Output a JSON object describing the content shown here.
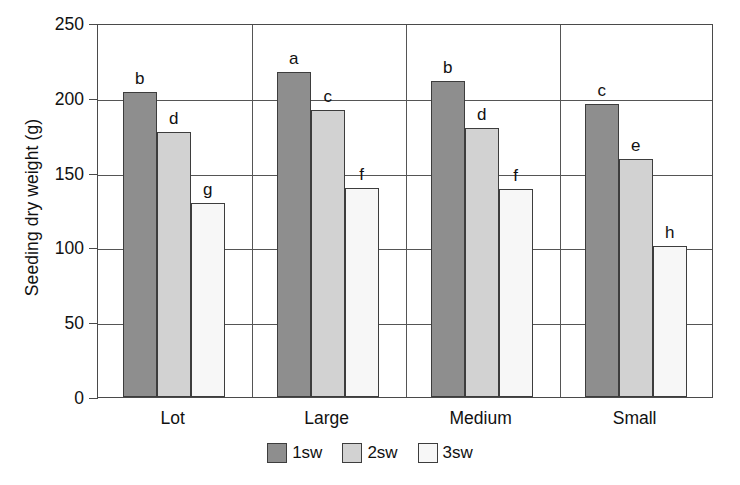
{
  "chart_data": {
    "type": "bar",
    "title": "",
    "xlabel": "",
    "ylabel": "Seeding dry weight (g)",
    "categories": [
      "Lot",
      "Large",
      "Medium",
      "Small"
    ],
    "ylim": [
      0,
      250
    ],
    "yticks": [
      0,
      50,
      100,
      150,
      200,
      250
    ],
    "ytick_labels": [
      "0",
      "50",
      "100",
      "150",
      "200",
      "250"
    ],
    "grid": true,
    "legend_position": "bottom",
    "series": [
      {
        "name": "1sw",
        "color": "#8e8e8e",
        "values": [
          204,
          217,
          211,
          196
        ],
        "letters": [
          "b",
          "a",
          "b",
          "c"
        ]
      },
      {
        "name": "2sw",
        "color": "#d2d2d2",
        "values": [
          177,
          192,
          180,
          159
        ],
        "letters": [
          "d",
          "c",
          "d",
          "e"
        ]
      },
      {
        "name": "3sw",
        "color": "#f7f7f7",
        "values": [
          130,
          140,
          139,
          101
        ],
        "letters": [
          "g",
          "f",
          "f",
          "h"
        ]
      }
    ]
  },
  "legend": {
    "items": [
      {
        "label": "1sw"
      },
      {
        "label": "2sw"
      },
      {
        "label": "3sw"
      }
    ]
  }
}
